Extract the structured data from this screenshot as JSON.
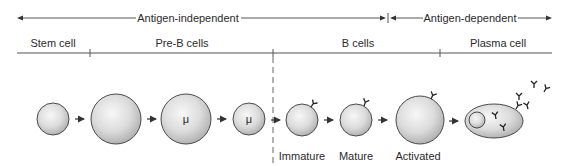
{
  "phases": {
    "independent": "Antigen-independent",
    "dependent": "Antigen-dependent"
  },
  "stages": {
    "stem": "Stem cell",
    "preb": "Pre-B cells",
    "bcells": "B cells",
    "plasma": "Plasma cell"
  },
  "cells": [
    {
      "name": "stem-cell",
      "marker": ""
    },
    {
      "name": "pre-b-cell-1",
      "marker": ""
    },
    {
      "name": "pre-b-cell-2",
      "marker": "μ"
    },
    {
      "name": "pre-b-cell-3",
      "marker": "μ"
    },
    {
      "name": "immature-b-cell",
      "marker": ""
    },
    {
      "name": "mature-b-cell",
      "marker": ""
    },
    {
      "name": "activated-b-cell",
      "marker": ""
    },
    {
      "name": "plasma-cell",
      "marker": ""
    }
  ],
  "sublabels": {
    "immature": "Immature",
    "mature": "Mature",
    "activated": "Activated"
  },
  "colors": {
    "line": "#555555",
    "cell_fill_light": "#f4f4f4",
    "cell_fill_dark": "#b9b9b9",
    "outline": "#4a4a4a"
  }
}
